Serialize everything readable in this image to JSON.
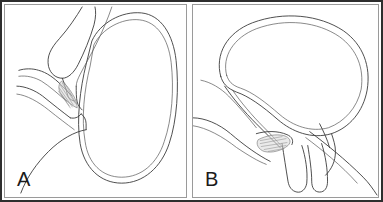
{
  "figure": {
    "type": "anatomical-line-diagram",
    "background_color": "#ffffff",
    "frame_color": "#2e2e2e",
    "panel_border_color": "#9a9a9a",
    "line_color": "#3a3a3a",
    "shading_color": "#d9d9d9",
    "panel_count": 2
  },
  "panels": [
    {
      "id": "a",
      "label": "A",
      "description": "Sagittal line drawing of bladder and adjacent pelvic structures, left panel"
    },
    {
      "id": "b",
      "label": "B",
      "description": "Sagittal line drawing of bladder and adjacent pelvic structures, right panel"
    }
  ]
}
